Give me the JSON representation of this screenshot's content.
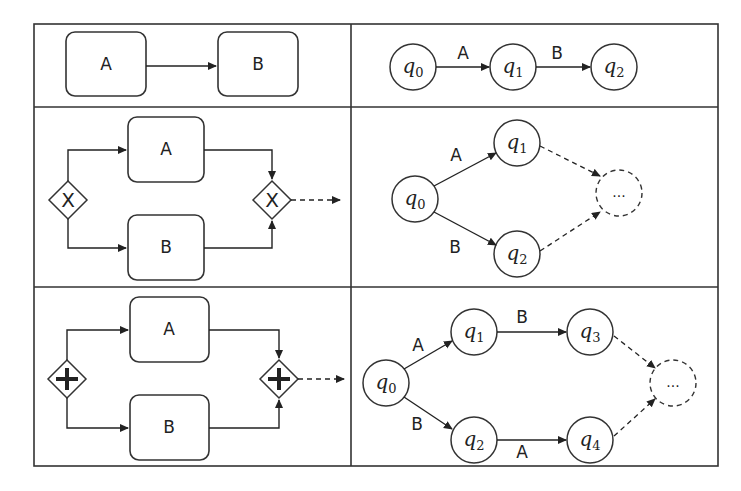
{
  "table": {
    "rows": [
      {
        "name": "sequence",
        "bpmn": {
          "tasks": [
            "A",
            "B"
          ]
        },
        "automaton": {
          "states": [
            {
              "id": "q0",
              "base": "q",
              "sub": "0"
            },
            {
              "id": "q1",
              "base": "q",
              "sub": "1"
            },
            {
              "id": "q2",
              "base": "q",
              "sub": "2"
            }
          ],
          "transitions": [
            {
              "from": "q0",
              "to": "q1",
              "label": "A"
            },
            {
              "from": "q1",
              "to": "q2",
              "label": "B"
            }
          ]
        }
      },
      {
        "name": "exclusive-choice",
        "bpmn": {
          "tasks": [
            "A",
            "B"
          ],
          "split_gateway": "X",
          "join_gateway": "X"
        },
        "automaton": {
          "states": [
            {
              "id": "q0",
              "base": "q",
              "sub": "0"
            },
            {
              "id": "q1",
              "base": "q",
              "sub": "1"
            },
            {
              "id": "q2",
              "base": "q",
              "sub": "2"
            }
          ],
          "transitions": [
            {
              "from": "q0",
              "to": "q1",
              "label": "A"
            },
            {
              "from": "q0",
              "to": "q2",
              "label": "B"
            }
          ],
          "continuation": "..."
        }
      },
      {
        "name": "parallel",
        "bpmn": {
          "tasks": [
            "A",
            "B"
          ],
          "split_gateway": "+",
          "join_gateway": "+"
        },
        "automaton": {
          "states": [
            {
              "id": "q0",
              "base": "q",
              "sub": "0"
            },
            {
              "id": "q1",
              "base": "q",
              "sub": "1"
            },
            {
              "id": "q2",
              "base": "q",
              "sub": "2"
            },
            {
              "id": "q3",
              "base": "q",
              "sub": "3"
            },
            {
              "id": "q4",
              "base": "q",
              "sub": "4"
            }
          ],
          "transitions": [
            {
              "from": "q0",
              "to": "q1",
              "label": "A"
            },
            {
              "from": "q0",
              "to": "q2",
              "label": "B"
            },
            {
              "from": "q1",
              "to": "q3",
              "label": "B"
            },
            {
              "from": "q2",
              "to": "q4",
              "label": "A"
            }
          ],
          "continuation": "..."
        }
      }
    ]
  }
}
